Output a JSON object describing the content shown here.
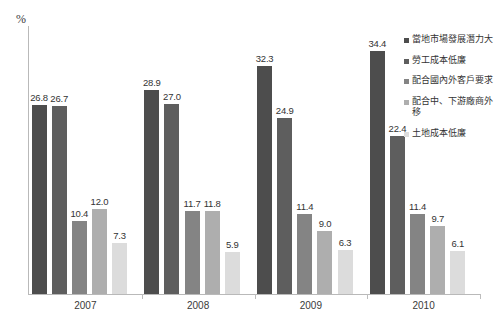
{
  "chart_data": {
    "type": "bar",
    "title": "",
    "subtitle": "",
    "xlabel": "",
    "ylabel": "%",
    "ylim": [
      0,
      38
    ],
    "grid": false,
    "legend_position": "right",
    "categories": [
      "2007",
      "2008",
      "2009",
      "2010"
    ],
    "series": [
      {
        "name": "當地市場發展潛力大",
        "color": "#4d4d4d",
        "values": [
          26.8,
          28.9,
          32.3,
          34.4
        ]
      },
      {
        "name": "勞工成本低廉",
        "color": "#5e5e5e",
        "values": [
          26.7,
          27.0,
          24.9,
          22.4
        ]
      },
      {
        "name": "配合國內外客戶要求",
        "color": "#848484",
        "values": [
          10.4,
          11.7,
          11.4,
          11.4
        ]
      },
      {
        "name": "配合中、下游廠商外移",
        "color": "#aeaeae",
        "values": [
          12.0,
          11.8,
          9.0,
          9.7
        ]
      },
      {
        "name": "土地成本低廉",
        "color": "#dcdcdc",
        "values": [
          7.3,
          5.9,
          6.3,
          6.1
        ]
      }
    ]
  },
  "axis": {
    "y_unit": "%"
  }
}
